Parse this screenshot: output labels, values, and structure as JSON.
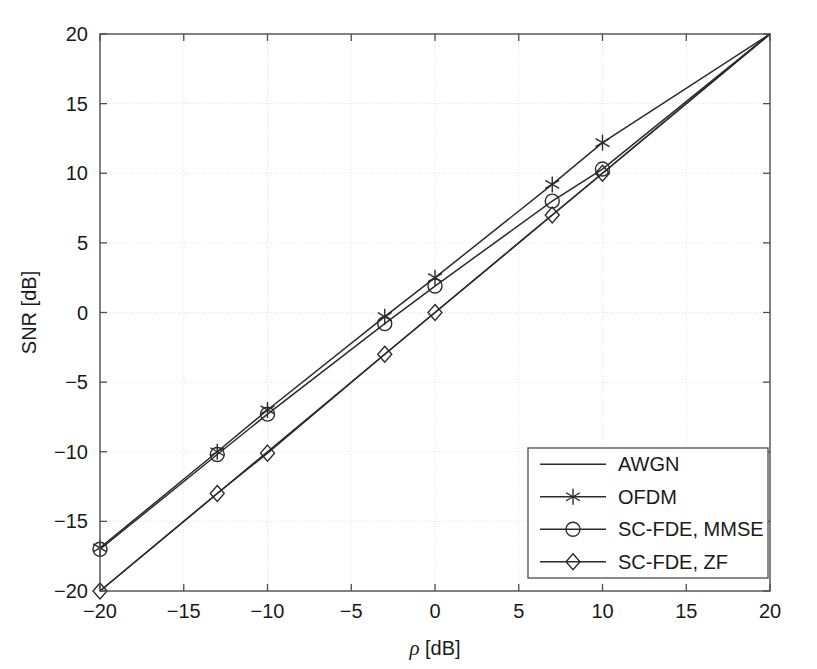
{
  "chart_data": {
    "type": "line",
    "title": "",
    "xlabel": "ρ [dB]",
    "ylabel": "SNR [dB]",
    "xlim": [
      -20,
      20
    ],
    "ylim": [
      -20,
      20
    ],
    "xticks": [
      -20,
      -15,
      -10,
      -5,
      0,
      5,
      10,
      15,
      20
    ],
    "xtick_labels": [
      "−20",
      "−15",
      "−10",
      "−5",
      "0",
      "5",
      "10",
      "15",
      "20"
    ],
    "yticks": [
      -20,
      -15,
      -10,
      -5,
      0,
      5,
      10,
      15,
      20
    ],
    "ytick_labels": [
      "−20",
      "−15",
      "−10",
      "−5",
      "0",
      "5",
      "10",
      "15",
      "20"
    ],
    "grid": true,
    "legend_position": "lower right",
    "series": [
      {
        "name": "AWGN",
        "marker": "none",
        "x": [
          -20,
          -13,
          -10,
          -3,
          0,
          7,
          10,
          20
        ],
        "values": [
          -20,
          -13,
          -10,
          -3,
          0,
          7,
          10,
          20
        ]
      },
      {
        "name": "OFDM",
        "marker": "asterisk",
        "x": [
          -20,
          -13,
          -10,
          -3,
          0,
          7,
          10,
          20
        ],
        "values": [
          -16.9,
          -10.0,
          -7.0,
          -0.3,
          2.5,
          9.2,
          12.2,
          20
        ],
        "marker_x": [
          -20,
          -13,
          -10,
          -3,
          0,
          7,
          10
        ],
        "marker_y": [
          -16.9,
          -10.0,
          -7.0,
          -0.3,
          2.5,
          9.2,
          12.2
        ]
      },
      {
        "name": "SC-FDE, MMSE",
        "marker": "circle",
        "x": [
          -20,
          -13,
          -10,
          -3,
          0,
          7,
          10,
          20
        ],
        "values": [
          -17.0,
          -10.2,
          -7.3,
          -0.8,
          1.9,
          8.0,
          10.3,
          20
        ],
        "marker_x": [
          -20,
          -13,
          -10,
          -3,
          0,
          7,
          10
        ],
        "marker_y": [
          -17.0,
          -10.2,
          -7.3,
          -0.8,
          1.9,
          8.0,
          10.3
        ]
      },
      {
        "name": "SC-FDE, ZF",
        "marker": "diamond",
        "x": [
          -20,
          -13,
          -10,
          -3,
          0,
          7,
          10,
          20
        ],
        "values": [
          -20.0,
          -13.0,
          -10.1,
          -3.0,
          0.0,
          7.0,
          10.0,
          20
        ],
        "marker_x": [
          -20,
          -13,
          -10,
          -3,
          0,
          7,
          10
        ],
        "marker_y": [
          -20.0,
          -13.0,
          -10.1,
          -3.0,
          0.0,
          7.0,
          10.0
        ]
      }
    ],
    "colors": {
      "line": "#2b2b2b",
      "grid": "#e2e2e2",
      "axis": "#4d4d4d",
      "text": "#1a1a1a",
      "background": "#ffffff"
    }
  },
  "legend": {
    "entries": [
      {
        "label": "AWGN",
        "marker": "none"
      },
      {
        "label": "OFDM",
        "marker": "asterisk"
      },
      {
        "label": "SC-FDE, MMSE",
        "marker": "circle"
      },
      {
        "label": "SC-FDE, ZF",
        "marker": "diamond"
      }
    ]
  }
}
